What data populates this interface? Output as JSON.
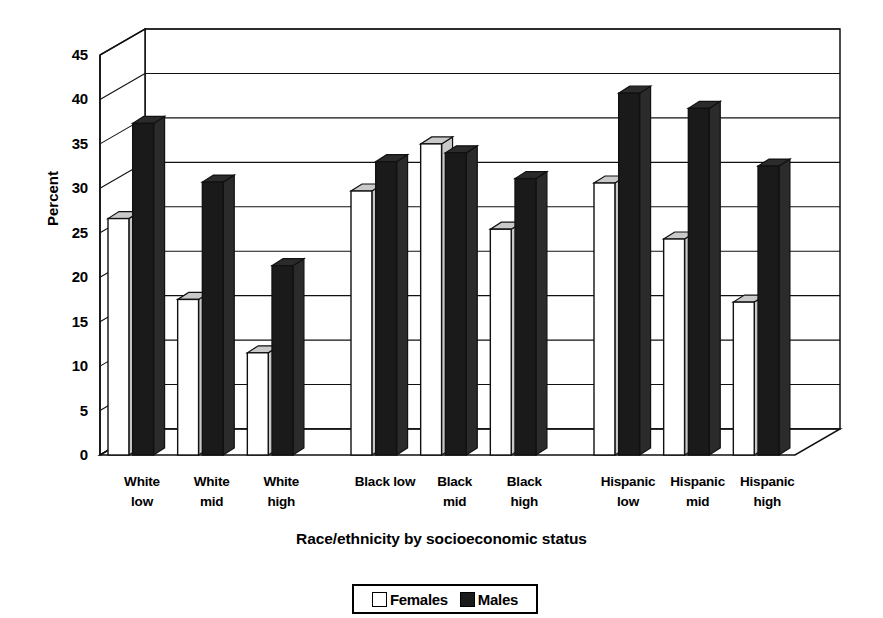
{
  "chart_data": {
    "type": "bar",
    "title": "",
    "xlabel": "Race/ethnicity by socioeconomic status",
    "ylabel": "Percent",
    "ylim": [
      0,
      45
    ],
    "ytick_step": 5,
    "yticks": [
      "45",
      "40",
      "35",
      "30",
      "25",
      "20",
      "15",
      "10",
      "5",
      "0"
    ],
    "grid": true,
    "style": "3d-clustered-column",
    "legend_position": "bottom-center",
    "categories": [
      "White low",
      "White mid",
      "White high",
      "Black low",
      "Black mid",
      "Black high",
      "Hispanic low",
      "Hispanic mid",
      "Hispanic high"
    ],
    "category_lines": [
      [
        "White",
        "low"
      ],
      [
        "White",
        "mid"
      ],
      [
        "White",
        "high"
      ],
      [
        "Black low",
        ""
      ],
      [
        "Black",
        "mid"
      ],
      [
        "Black",
        "high"
      ],
      [
        "Hispanic",
        "low"
      ],
      [
        "Hispanic",
        "mid"
      ],
      [
        "Hispanic",
        "high"
      ]
    ],
    "series": [
      {
        "name": "Females",
        "color": "#ffffff",
        "values": [
          26.6,
          17.5,
          11.5,
          29.7,
          35.0,
          25.4,
          30.6,
          24.3,
          17.2
        ]
      },
      {
        "name": "Males",
        "color": "#1a1a1a",
        "values": [
          37.3,
          30.7,
          21.3,
          33.0,
          34.0,
          31.1,
          40.7,
          39.0,
          32.5
        ]
      }
    ],
    "group_breaks_after": [
      3,
      6
    ]
  },
  "legend": {
    "items": [
      {
        "label": "Females",
        "swatch": "white-square-swatch"
      },
      {
        "label": "Males",
        "swatch": "black-square-swatch"
      }
    ]
  },
  "axes": {
    "y_title": "Percent",
    "x_title": "Race/ethnicity by socioeconomic status"
  }
}
